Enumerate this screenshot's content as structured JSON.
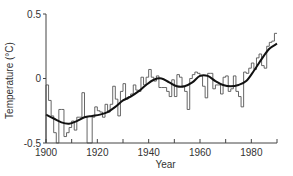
{
  "chart_data": {
    "type": "line",
    "title": "",
    "xlabel": "Year",
    "ylabel": "Temperature (°C)",
    "xlim": [
      1900,
      1990
    ],
    "ylim": [
      -0.5,
      0.5
    ],
    "grid": false,
    "legend": "none",
    "x_ticks": [
      1900,
      1910,
      1920,
      1930,
      1940,
      1950,
      1960,
      1970,
      1980,
      1990
    ],
    "x_tick_labels": [
      {
        "value": 1900,
        "label": "1900"
      },
      {
        "value": 1920,
        "label": "1920"
      },
      {
        "value": 1940,
        "label": "1940"
      },
      {
        "value": 1960,
        "label": "1960"
      },
      {
        "value": 1980,
        "label": "1980"
      }
    ],
    "y_tick_labels": [
      {
        "value": 0.5,
        "label": "0.5"
      },
      {
        "value": 0,
        "label": "0"
      },
      {
        "value": -0.5,
        "label": "-0.5"
      }
    ],
    "series": [
      {
        "name": "Annual temperature anomaly",
        "style": "step",
        "color": "#555555",
        "x": [
          1900,
          1901,
          1902,
          1903,
          1904,
          1905,
          1906,
          1907,
          1908,
          1909,
          1910,
          1911,
          1912,
          1913,
          1914,
          1915,
          1916,
          1917,
          1918,
          1919,
          1920,
          1921,
          1922,
          1923,
          1924,
          1925,
          1926,
          1927,
          1928,
          1929,
          1930,
          1931,
          1932,
          1933,
          1934,
          1935,
          1936,
          1937,
          1938,
          1939,
          1940,
          1941,
          1942,
          1943,
          1944,
          1945,
          1946,
          1947,
          1948,
          1949,
          1950,
          1951,
          1952,
          1953,
          1954,
          1955,
          1956,
          1957,
          1958,
          1959,
          1960,
          1961,
          1962,
          1963,
          1964,
          1965,
          1966,
          1967,
          1968,
          1969,
          1970,
          1971,
          1972,
          1973,
          1974,
          1975,
          1976,
          1977,
          1978,
          1979,
          1980,
          1981,
          1982,
          1983,
          1984,
          1985,
          1986,
          1987,
          1988,
          1989
        ],
        "values": [
          -0.05,
          -0.17,
          -0.29,
          -0.42,
          -0.5,
          -0.24,
          -0.24,
          -0.45,
          -0.42,
          -0.38,
          -0.33,
          -0.4,
          -0.3,
          -0.3,
          -0.11,
          -0.3,
          -0.5,
          -0.5,
          -0.3,
          -0.22,
          -0.25,
          -0.26,
          -0.3,
          -0.2,
          -0.26,
          -0.2,
          -0.06,
          -0.16,
          -0.29,
          -0.1,
          -0.04,
          -0.16,
          -0.14,
          -0.12,
          -0.05,
          -0.09,
          -0.1,
          0.01,
          -0.05,
          0.01,
          0.07,
          0.01,
          -0.02,
          0.02,
          -0.07,
          -0.07,
          -0.07,
          -0.1,
          -0.14,
          -0.01,
          -0.14,
          0.03,
          0.01,
          -0.06,
          -0.1,
          -0.24,
          0.0,
          0.03,
          0.05,
          0.04,
          0.02,
          -0.06,
          -0.15,
          0.04,
          0.04,
          -0.08,
          -0.05,
          -0.05,
          -0.12,
          0.01,
          0.02,
          -0.1,
          -0.08,
          0.02,
          -0.1,
          -0.14,
          -0.22,
          0.05,
          0.04,
          0.08,
          0.12,
          0.07,
          0.16,
          0.19,
          0.1,
          0.08,
          0.25,
          0.28,
          0.29,
          0.35
        ]
      },
      {
        "name": "Smoothed trend",
        "style": "smooth",
        "color": "#111111",
        "x": [
          1900,
          1903,
          1906,
          1909,
          1912,
          1915,
          1918,
          1921,
          1924,
          1927,
          1930,
          1933,
          1936,
          1939,
          1942,
          1945,
          1948,
          1951,
          1954,
          1957,
          1960,
          1963,
          1966,
          1969,
          1972,
          1975,
          1978,
          1981,
          1984,
          1987,
          1990
        ],
        "values": [
          -0.28,
          -0.31,
          -0.34,
          -0.35,
          -0.33,
          -0.3,
          -0.29,
          -0.28,
          -0.26,
          -0.22,
          -0.17,
          -0.14,
          -0.1,
          -0.05,
          -0.01,
          0.0,
          -0.03,
          -0.06,
          -0.06,
          -0.03,
          0.02,
          0.02,
          -0.02,
          -0.05,
          -0.06,
          -0.05,
          -0.02,
          0.06,
          0.15,
          0.23,
          0.27
        ]
      }
    ]
  }
}
